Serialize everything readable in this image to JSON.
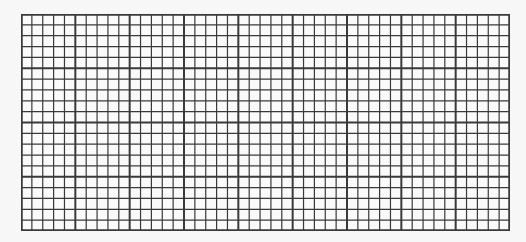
{
  "grid": {
    "columns": 45,
    "rows": 20,
    "major_every": 5,
    "width": 489,
    "height": 217,
    "line_color": "#3a3a3a",
    "minor_width": 1.2,
    "major_width": 2.0,
    "paper_color": "#fafafa"
  }
}
